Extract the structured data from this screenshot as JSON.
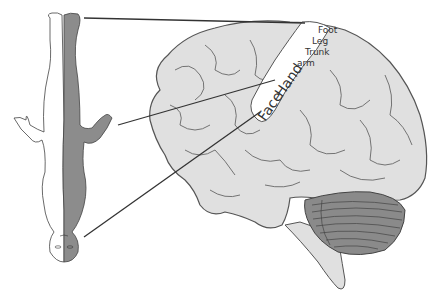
{
  "figure": {
    "colors": {
      "brain_fill": "#e0e0e0",
      "brain_outline": "#555555",
      "cortex_strip": "#ffffff",
      "cerebellum": "#8a8a8a",
      "body_shaded": "#8c8c8c",
      "body_white": "#ffffff",
      "pointer_line": "#333333"
    },
    "labels": {
      "foot": "Foot",
      "leg": "Leg",
      "trunk": "Trunk",
      "arm": "arm",
      "hand": "Hand",
      "face": "Face"
    },
    "parts": {
      "homunculus": "Inverted human body figure (half white, half shaded)",
      "brain": "Lateral view of brain",
      "cerebellum": "Cerebellum",
      "brainstem": "Brainstem"
    }
  }
}
